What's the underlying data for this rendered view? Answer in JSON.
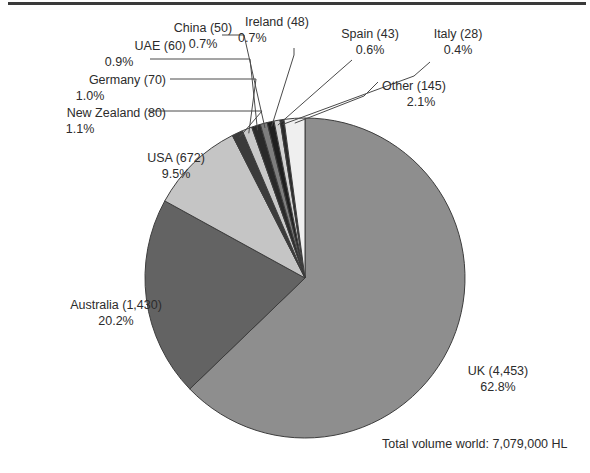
{
  "figure": {
    "footnote": "Total volume world: 7,079,000 HL"
  },
  "chart_data": {
    "type": "pie",
    "title": "",
    "unit": "HL",
    "total_label": "Total volume world: 7,079,000 HL",
    "total_value": 7079000,
    "legend_position": "callout-labels",
    "categories": [
      "UK",
      "Australia",
      "USA",
      "New Zealand",
      "Germany",
      "UAE",
      "China",
      "Ireland",
      "Spain",
      "Italy",
      "Other"
    ],
    "values": [
      4453,
      1430,
      672,
      80,
      70,
      60,
      50,
      48,
      43,
      28,
      145
    ],
    "percents": [
      62.8,
      20.2,
      9.5,
      1.1,
      1.0,
      0.9,
      0.7,
      0.7,
      0.6,
      0.4,
      2.1
    ],
    "value_labels": [
      "4,453",
      "1,430",
      "672",
      "80",
      "70",
      "60",
      "50",
      "48",
      "43",
      "28",
      "145"
    ],
    "percent_labels": [
      "62.8%",
      "20.2%",
      "9.5%",
      "1.1%",
      "1.0%",
      "0.9%",
      "0.7%",
      "0.7%",
      "0.6%",
      "0.4%",
      "2.1%"
    ],
    "slice_colors": [
      "#8e8e8e",
      "#636363",
      "#c5c5c5",
      "#3b3b3b",
      "#c9c9c9",
      "#2a2a2a",
      "#7e7e7e",
      "#1f1f1f",
      "#d2d2d2",
      "#2a2a2a",
      "#efefef"
    ],
    "slices": [
      {
        "name": "UK",
        "value_label": "4,453",
        "percent_label": "62.8%",
        "percent": 62.8,
        "color": "#8e8e8e",
        "label_text_1": "UK (4,453)",
        "label_text_2": "62.8%"
      },
      {
        "name": "Australia",
        "value_label": "1,430",
        "percent_label": "20.2%",
        "percent": 20.2,
        "color": "#636363",
        "label_text_1": "Australia (1,430)",
        "label_text_2": "20.2%"
      },
      {
        "name": "USA",
        "value_label": "672",
        "percent_label": "9.5%",
        "percent": 9.5,
        "color": "#c5c5c5",
        "label_text_1": "USA (672)",
        "label_text_2": "9.5%"
      },
      {
        "name": "New Zealand",
        "value_label": "80",
        "percent_label": "1.1%",
        "percent": 1.1,
        "color": "#3b3b3b",
        "label_text_1": "New Zealand (80)",
        "label_text_2": "1.1%"
      },
      {
        "name": "Germany",
        "value_label": "70",
        "percent_label": "1.0%",
        "percent": 1.0,
        "color": "#c9c9c9",
        "label_text_1": "Germany (70)",
        "label_text_2": "1.0%"
      },
      {
        "name": "UAE",
        "value_label": "60",
        "percent_label": "0.9%",
        "percent": 0.9,
        "color": "#2a2a2a",
        "label_text_1": "UAE (60)",
        "label_text_2": "0.9%"
      },
      {
        "name": "China",
        "value_label": "50",
        "percent_label": "0.7%",
        "percent": 0.7,
        "color": "#7e7e7e",
        "label_text_1": "China (50)",
        "label_text_2": "0.7%"
      },
      {
        "name": "Ireland",
        "value_label": "48",
        "percent_label": "0.7%",
        "percent": 0.7,
        "color": "#1f1f1f",
        "label_text_1": "Ireland (48)",
        "label_text_2": "0.7%"
      },
      {
        "name": "Spain",
        "value_label": "43",
        "percent_label": "0.6%",
        "percent": 0.6,
        "color": "#d2d2d2",
        "label_text_1": "Spain (43)",
        "label_text_2": "0.6%"
      },
      {
        "name": "Italy",
        "value_label": "28",
        "percent_label": "0.4%",
        "percent": 0.4,
        "color": "#2a2a2a",
        "label_text_1": "Italy (28)",
        "label_text_2": "0.4%"
      },
      {
        "name": "Other",
        "value_label": "145",
        "percent_label": "2.1%",
        "percent": 2.1,
        "color": "#efefef",
        "label_text_1": "Other (145)",
        "label_text_2": "2.1%"
      }
    ]
  }
}
